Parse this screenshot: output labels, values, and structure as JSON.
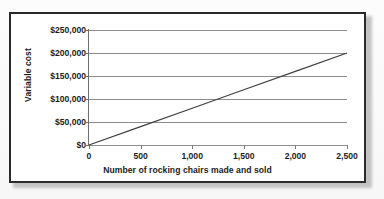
{
  "chart_data": {
    "type": "line",
    "title": "",
    "xlabel": "Number of rocking chairs made and sold",
    "ylabel": "Variable cost",
    "xlim": [
      0,
      2500
    ],
    "ylim": [
      0,
      250000
    ],
    "grid": true,
    "legend": "none",
    "x_ticks": [
      0,
      500,
      1000,
      1500,
      2000,
      2500
    ],
    "x_tick_labels": [
      "0",
      "500",
      "1,000",
      "1,500",
      "2,000",
      "2,500"
    ],
    "y_ticks": [
      0,
      50000,
      100000,
      150000,
      200000,
      250000
    ],
    "y_tick_labels": [
      "$0",
      "$50,000",
      "$100,000",
      "$150,000",
      "$200,000",
      "$250,000"
    ],
    "series": [
      {
        "name": "Variable cost",
        "color": "#3f3f3f",
        "x": [
          0,
          500,
          1000,
          1500,
          2000,
          2500
        ],
        "values": [
          0,
          40000,
          80000,
          120000,
          160000,
          200000
        ]
      }
    ],
    "slope_per_unit": 80
  },
  "figure": {
    "frame_color": "#2a2a2a",
    "background_color": "#ffffff",
    "gridline_color": "#8d8d8d",
    "axis_color": "#6e6e6e",
    "text_color": "#1c1c1c"
  }
}
